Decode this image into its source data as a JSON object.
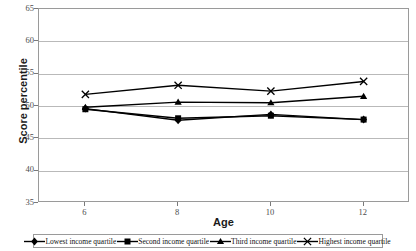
{
  "chart_data": {
    "type": "line",
    "title": "",
    "xlabel": "Age",
    "ylabel": "Score percentile",
    "x": [
      6,
      8,
      10,
      12
    ],
    "xtick_labels": [
      "6",
      "8",
      "10",
      "12"
    ],
    "xlim": [
      5,
      13
    ],
    "ylim": [
      35,
      65
    ],
    "ytick_labels": [
      "35",
      "40",
      "45",
      "50",
      "55",
      "60",
      "65"
    ],
    "yticks": [
      35,
      40,
      45,
      50,
      55,
      60,
      65
    ],
    "grid": "horizontal",
    "legend_position": "bottom",
    "series": [
      {
        "name": "Lowest income quartile",
        "marker": "diamond",
        "color": "#000000",
        "values": [
          49.6,
          47.8,
          48.7,
          47.9
        ]
      },
      {
        "name": "Second income quartile",
        "marker": "square",
        "color": "#000000",
        "values": [
          49.5,
          48.1,
          48.5,
          47.9
        ]
      },
      {
        "name": "Third income quartile",
        "marker": "triangle",
        "color": "#000000",
        "values": [
          49.8,
          50.6,
          50.5,
          51.5
        ]
      },
      {
        "name": "Highest income quartile",
        "marker": "cross",
        "color": "#000000",
        "values": [
          51.8,
          53.2,
          52.3,
          53.8
        ]
      }
    ]
  },
  "top_clipped_text": "",
  "axis": {
    "y_title": "Score percentile",
    "x_title": "Age"
  },
  "colors": {
    "plot_border": "#9a9a9a",
    "gridline": "#b9b9b9",
    "series": "#000000",
    "tick_text": "#4d4d4d",
    "title_text": "#1a1a1a",
    "background": "#ffffff"
  }
}
